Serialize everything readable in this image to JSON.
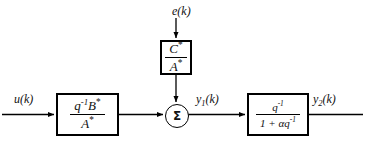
{
  "diagram": {
    "colors": {
      "line": "#000000",
      "background": "#ffffff",
      "text": "#111111"
    },
    "signals": {
      "input": "u(k)",
      "noise": "e(k)",
      "intermediate": "y",
      "intermediate_sub": "1",
      "intermediate_suffix": "(k)",
      "output": "y",
      "output_sub": "2",
      "output_suffix": "(k)"
    },
    "blocks": [
      {
        "name": "plant-transfer-function",
        "numerator_base": "q",
        "numerator_exp": "-1",
        "numerator_tail": "B",
        "numerator_star": "*",
        "denominator": "A",
        "denominator_star": "*"
      },
      {
        "name": "noise-transfer-function",
        "numerator": "C",
        "numerator_star": "*",
        "denominator": "A",
        "denominator_star": "*"
      },
      {
        "name": "output-filter-transfer-function",
        "numerator_base": "q",
        "numerator_exp": "-1",
        "denominator_lead": "1 + ",
        "denominator_alpha": "α",
        "denominator_base": "q",
        "denominator_exp": "-1"
      }
    ],
    "summing_junction": {
      "symbol": "Σ"
    }
  }
}
